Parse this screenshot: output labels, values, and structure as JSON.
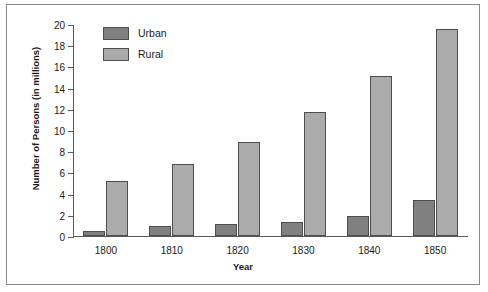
{
  "chart_data": {
    "type": "bar",
    "title": "",
    "xlabel": "Year",
    "ylabel": "Number of Persons (in millions)",
    "categories": [
      "1800",
      "1810",
      "1820",
      "1830",
      "1840",
      "1850"
    ],
    "series": [
      {
        "name": "Urban",
        "color": "#808080",
        "values": [
          0.5,
          0.9,
          1.1,
          1.3,
          1.9,
          3.4
        ]
      },
      {
        "name": "Rural",
        "color": "#ababab",
        "values": [
          5.2,
          6.8,
          8.9,
          11.7,
          15.1,
          19.5
        ]
      }
    ],
    "ylim": [
      0,
      20
    ],
    "y_ticks": [
      0,
      2,
      4,
      6,
      8,
      10,
      12,
      14,
      16,
      18,
      20
    ],
    "grid": false,
    "legend_position": "top-left"
  },
  "legend": {
    "items": [
      {
        "label": "Urban"
      },
      {
        "label": "Rural"
      }
    ]
  }
}
